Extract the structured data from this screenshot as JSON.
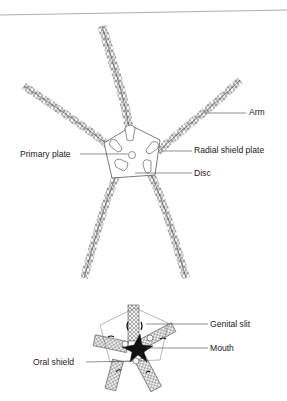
{
  "diagram": {
    "aboral_view": {
      "labels": {
        "arm": "Arm",
        "radial_shield_plate": "Radial shield plate",
        "primary_plate": "Primary plate",
        "disc": "Disc"
      }
    },
    "oral_view": {
      "labels": {
        "genital_slit": "Genital slit",
        "mouth": "Mouth",
        "oral_shield": "Oral shield"
      }
    },
    "colors": {
      "line": "#444444",
      "text": "#222222",
      "rule": "#999999"
    }
  }
}
